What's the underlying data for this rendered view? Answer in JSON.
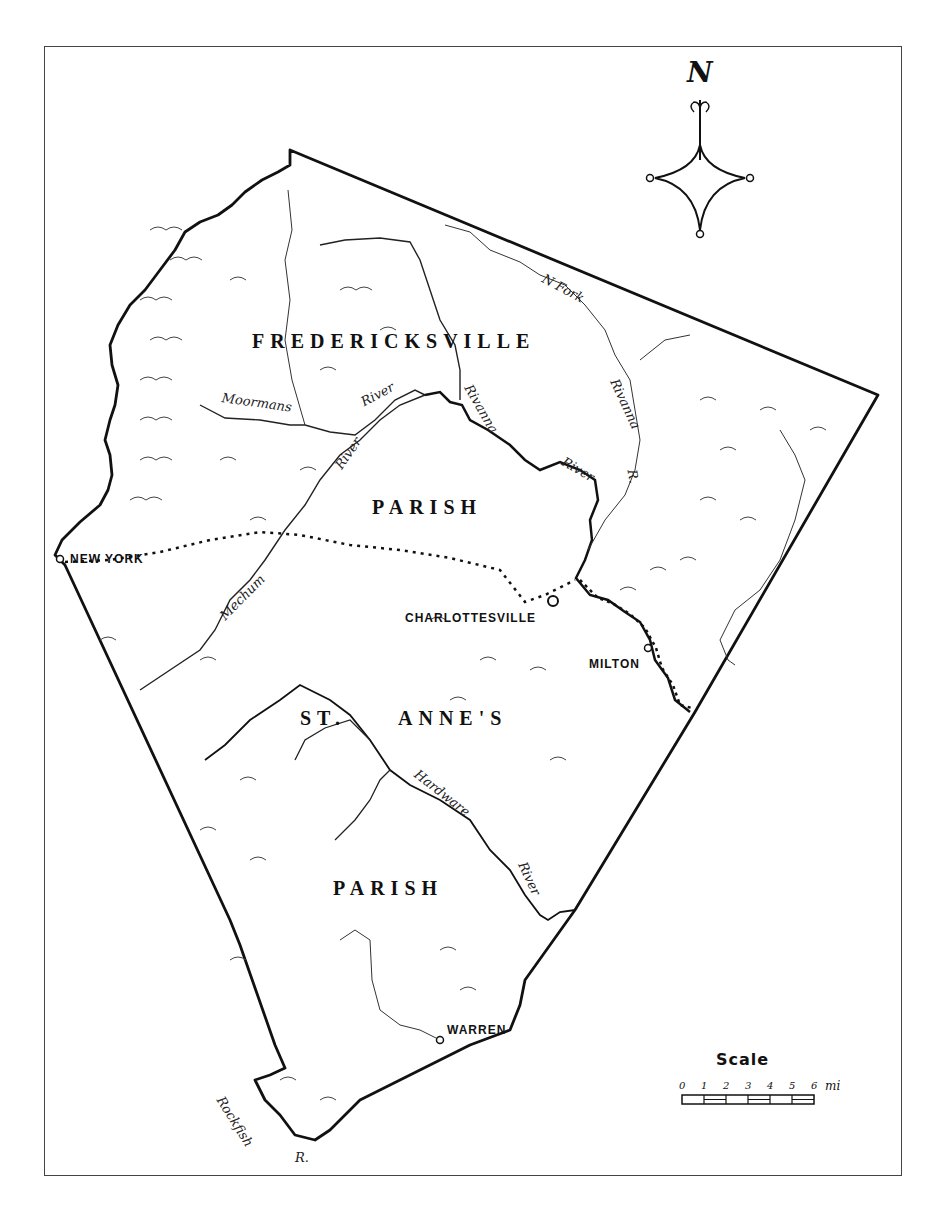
{
  "map": {
    "colors": {
      "ink": "#111111",
      "paper": "#ffffff",
      "frame": "#444444"
    },
    "compass": {
      "label": "N"
    },
    "parishes": [
      {
        "name": "FREDERICKSVILLE"
      },
      {
        "name": "PARISH"
      },
      {
        "name": "ST."
      },
      {
        "name": "ANNE'S"
      },
      {
        "name": "PARISH"
      }
    ],
    "towns": [
      {
        "name": "NEW YORK"
      },
      {
        "name": "CHARLOTTESVILLE"
      },
      {
        "name": "MILTON"
      },
      {
        "name": "WARREN"
      }
    ],
    "rivers": [
      {
        "label": "N Fork"
      },
      {
        "label": "Rivanna"
      },
      {
        "label": "R."
      },
      {
        "label": "Rivanna"
      },
      {
        "label": "River"
      },
      {
        "label": "Moormans"
      },
      {
        "label": "River"
      },
      {
        "label": "River"
      },
      {
        "label": "Mechum"
      },
      {
        "label": "Hardware"
      },
      {
        "label": "River"
      },
      {
        "label": "Rockfish"
      },
      {
        "label": "R."
      }
    ],
    "scale": {
      "title": "Scale",
      "ticks": [
        "0",
        "1",
        "2",
        "3",
        "4",
        "5",
        "6"
      ],
      "unit": "mi"
    }
  }
}
